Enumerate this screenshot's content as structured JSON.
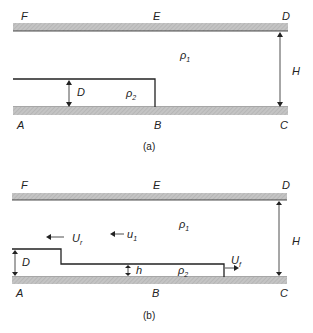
{
  "panels": [
    {
      "id": "a",
      "caption": "(a)",
      "corner_labels": {
        "F": "F",
        "E": "E",
        "D": "D",
        "A": "A",
        "B": "B",
        "C": "C"
      },
      "density_upper": "ρ",
      "density_upper_sub": "1",
      "density_lower": "ρ",
      "density_lower_sub": "2",
      "depth_label": "D",
      "height_label": "H"
    },
    {
      "id": "b",
      "caption": "(b)",
      "corner_labels": {
        "F": "F",
        "E": "E",
        "D": "D",
        "A": "A",
        "B": "B",
        "C": "C"
      },
      "density_upper": "ρ",
      "density_upper_sub": "1",
      "density_lower": "ρ",
      "density_lower_sub": "2",
      "depth_label": "D",
      "current_depth_label": "h",
      "height_label": "H",
      "rarefaction_speed": "U",
      "rarefaction_speed_sub": "r",
      "return_flow": "u",
      "return_flow_sub": "1",
      "front_speed": "U",
      "front_speed_sub": "f"
    }
  ],
  "colors": {
    "wall": "#bdbdbd",
    "line": "#222222"
  }
}
